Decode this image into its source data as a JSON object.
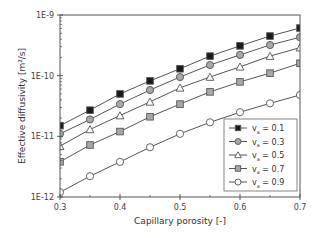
{
  "chart_data": {
    "type": "line",
    "title": "",
    "xlabel": "Capillary porosity [-]",
    "ylabel": "Effective diffusivity [m²/s]",
    "xlim": [
      0.3,
      0.7
    ],
    "ylim": [
      1e-12,
      1e-09
    ],
    "yscale": "log",
    "grid": false,
    "legend_position": "lower right",
    "x_ticks": [
      "0.3",
      "0.4",
      "0.5",
      "0.6",
      "0.7"
    ],
    "y_ticks": [
      "1E-12",
      "1E-11",
      "1E-10",
      "1E-9"
    ],
    "x": [
      0.3,
      0.35,
      0.4,
      0.45,
      0.5,
      0.55,
      0.6,
      0.65,
      0.7
    ],
    "series": [
      {
        "name": "va = 0.1",
        "label_main": "v",
        "label_sub": "a",
        "label_value": " = 0.1",
        "marker": "square",
        "fill": "#1a1a1a",
        "values": [
          1.5e-11,
          2.7e-11,
          5e-11,
          8.2e-11,
          1.3e-10,
          2.1e-10,
          3.1e-10,
          4.5e-10,
          6.1e-10
        ]
      },
      {
        "name": "va = 0.3",
        "label_main": "v",
        "label_sub": "a",
        "label_value": " = 0.3",
        "marker": "circle",
        "fill": "#a8a8a8",
        "values": [
          1.1e-11,
          1.9e-11,
          3.4e-11,
          5.8e-11,
          9.5e-11,
          1.5e-10,
          2.2e-10,
          3.2e-10,
          4.3e-10
        ]
      },
      {
        "name": "va = 0.5",
        "label_main": "v",
        "label_sub": "a",
        "label_value": " = 0.5",
        "marker": "triangle",
        "fill": "#ffffff",
        "values": [
          6.9e-12,
          1.3e-11,
          2.2e-11,
          3.7e-11,
          6.3e-11,
          9.5e-11,
          1.4e-10,
          2.1e-10,
          2.9e-10
        ]
      },
      {
        "name": "va = 0.7",
        "label_main": "v",
        "label_sub": "a",
        "label_value": " = 0.7",
        "marker": "square",
        "fill": "#a8a8a8",
        "values": [
          3.8e-12,
          7.2e-12,
          1.2e-11,
          2.1e-11,
          3.4e-11,
          5.4e-11,
          7.9e-11,
          1.1e-10,
          1.6e-10
        ]
      },
      {
        "name": "va = 0.9",
        "label_main": "v",
        "label_sub": "a",
        "label_value": " = 0.9",
        "marker": "circle",
        "fill": "#ffffff",
        "values": [
          1.2e-12,
          2.2e-12,
          3.8e-12,
          6.6e-12,
          1.1e-11,
          1.7e-11,
          2.5e-11,
          3.5e-11,
          4.8e-11
        ]
      }
    ]
  },
  "colors": {
    "axis": "#555555",
    "line": "#555555",
    "marker_stroke": "#555555",
    "legend_border": "#666666"
  }
}
